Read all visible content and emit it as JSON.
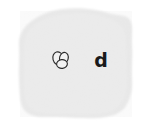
{
  "canvas": {
    "width": 147,
    "height": 127,
    "background_color": "#ffffff"
  },
  "backdrop": {
    "name": "gray-blob-patch",
    "description": "irregular light-gray rounded splotch covering most of the frame",
    "fill_color": "#e9e9e9",
    "edge_color": "#f1f1f1",
    "bounds": {
      "left": 18,
      "top": 9,
      "right": 133,
      "bottom": 118
    }
  },
  "marks": {
    "icon": {
      "name": "overlapping-beans-icon",
      "semantic": "two-overlapping-ovals",
      "stroke_color": "#2b2b2b",
      "fill_color": "#f0f0f0",
      "x": 51,
      "y": 50,
      "width": 20,
      "height": 22
    },
    "letter": {
      "name": "letter-d-label",
      "text": "d",
      "color": "#1a1a1a",
      "weight": "bold",
      "font_size_px": 19,
      "x": 98,
      "y": 60
    }
  }
}
